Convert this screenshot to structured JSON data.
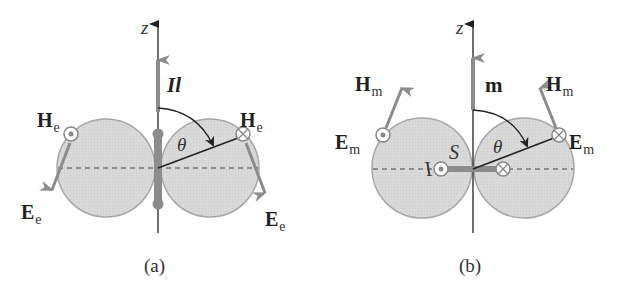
{
  "figure": {
    "panels": [
      {
        "id": "a",
        "caption": "(a)",
        "axis_label": "z",
        "source_label": "Il",
        "source_description": "electric dipole (current element)",
        "angle_label": "θ",
        "field_labels": {
          "H_left": {
            "main": "H",
            "sub": "e"
          },
          "H_right": {
            "main": "H",
            "sub": "e"
          },
          "E_left": {
            "main": "E",
            "sub": "e"
          },
          "E_right": {
            "main": "E",
            "sub": "e"
          }
        },
        "symbols": {
          "left": "dot-out-of-page",
          "right": "cross-into-page"
        }
      },
      {
        "id": "b",
        "caption": "(b)",
        "axis_label": "z",
        "source_label": "m",
        "source_description": "magnetic dipole (current loop)",
        "current_label": "I",
        "area_label": "S",
        "angle_label": "θ",
        "field_labels": {
          "H_left": {
            "main": "H",
            "sub": "m"
          },
          "H_right": {
            "main": "H",
            "sub": "m"
          },
          "E_left": {
            "main": "E",
            "sub": "m"
          },
          "E_right": {
            "main": "E",
            "sub": "m"
          }
        },
        "symbols": {
          "left": "dot-out-of-page",
          "right": "cross-into-page"
        }
      }
    ],
    "colors": {
      "lobe_fill": "#d9d9d9",
      "lobe_stroke": "#a8a8a8",
      "vector_gray": "#8c8c8c",
      "ink": "#222222"
    }
  }
}
